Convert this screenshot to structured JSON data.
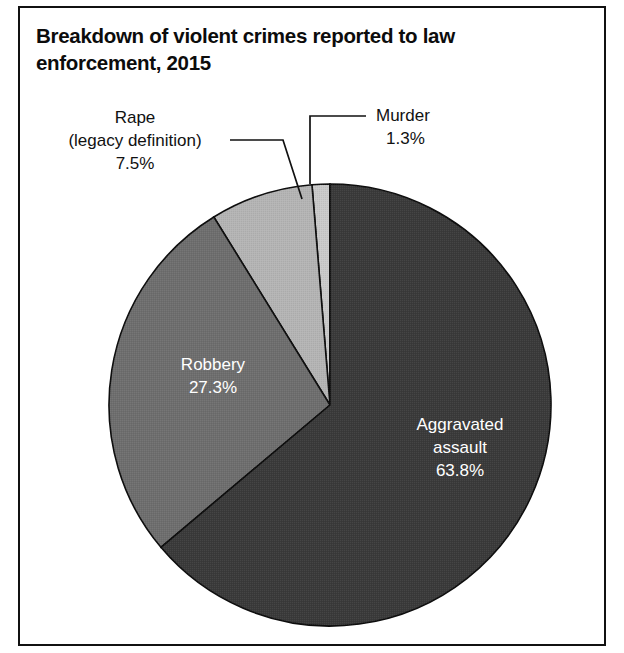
{
  "figure": {
    "title": "Breakdown of violent crimes reported to law enforcement, 2015",
    "background_color": "#ffffff",
    "frame_color": "#111111"
  },
  "chart_data": {
    "type": "pie",
    "title": "Breakdown of violent crimes reported to law enforcement, 2015",
    "xlabel": "",
    "ylabel": "",
    "grid": false,
    "legend": "none",
    "total_percent": 99.9,
    "start_angle_deg": 90,
    "direction": "counterclockwise",
    "categories": [
      "Murder",
      "Rape (legacy definition)",
      "Robbery",
      "Aggravated assault"
    ],
    "values": [
      1.3,
      7.5,
      27.3,
      63.8
    ],
    "slices": [
      {
        "label": "Murder",
        "label_line1": "Murder",
        "label_line2": "1.3%",
        "value": 1.3,
        "value_text": "1.3%",
        "color": "#c9c9c9",
        "label_placement": "callout-outside-top-right",
        "label_color": "#111111"
      },
      {
        "label": "Rape (legacy definition)",
        "label_line1": "Rape",
        "label_line2": "(legacy definition)",
        "label_line3": "7.5%",
        "value": 7.5,
        "value_text": "7.5%",
        "color": "#b4b4b4",
        "label_placement": "callout-outside-top-left",
        "label_color": "#111111"
      },
      {
        "label": "Robbery",
        "label_line1": "Robbery",
        "label_line2": "27.3%",
        "value": 27.3,
        "value_text": "27.3%",
        "color": "#6e6e6e",
        "label_placement": "inside",
        "label_color": "#ffffff"
      },
      {
        "label": "Aggravated assault",
        "label_line1": "Aggravated",
        "label_line2": "assault",
        "label_line3": "63.8%",
        "value": 63.8,
        "value_text": "63.8%",
        "color": "#3a3a3a",
        "label_placement": "inside",
        "label_color": "#ffffff"
      }
    ]
  }
}
